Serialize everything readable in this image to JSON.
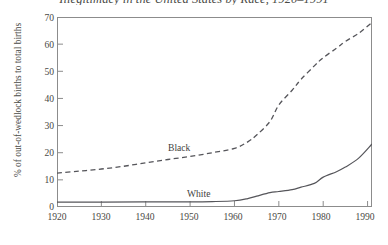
{
  "chart_data": {
    "type": "line",
    "title": "Illegitimacy in the United States by Race, 1920–1991",
    "xlabel": "",
    "ylabel": "% of out-of-wedlock births to total births",
    "xlim": [
      1920,
      1991
    ],
    "ylim": [
      0,
      70
    ],
    "grid": false,
    "legend_position": "inline-annotation",
    "xticks": [
      "1920",
      "1930",
      "1940",
      "1950",
      "1960",
      "1970",
      "1980",
      "1990"
    ],
    "xtick_values": [
      1920,
      1930,
      1940,
      1950,
      1960,
      1970,
      1980,
      1990
    ],
    "yticks": [
      "0",
      "10",
      "20",
      "30",
      "40",
      "50",
      "60",
      "70"
    ],
    "ytick_values": [
      0,
      10,
      20,
      30,
      40,
      50,
      60,
      70
    ],
    "series": [
      {
        "name": "Black",
        "style": "dashed",
        "color": "#55555a",
        "x": [
          1920,
          1925,
          1930,
          1935,
          1940,
          1945,
          1950,
          1955,
          1960,
          1963,
          1965,
          1968,
          1970,
          1973,
          1975,
          1978,
          1980,
          1983,
          1985,
          1988,
          1991
        ],
        "values": [
          12.5,
          13.2,
          14.0,
          15.0,
          16.3,
          17.5,
          18.6,
          20.0,
          21.6,
          24.0,
          26.5,
          31.5,
          37.6,
          43.0,
          47.0,
          52.0,
          55.0,
          58.5,
          61.0,
          64.0,
          68.0
        ]
      },
      {
        "name": "White",
        "style": "solid",
        "color": "#55555a",
        "x": [
          1920,
          1930,
          1940,
          1950,
          1955,
          1960,
          1963,
          1965,
          1968,
          1970,
          1973,
          1975,
          1978,
          1980,
          1983,
          1985,
          1988,
          1991
        ],
        "values": [
          1.8,
          1.8,
          1.9,
          1.9,
          2.0,
          2.3,
          3.1,
          4.0,
          5.3,
          5.7,
          6.4,
          7.3,
          8.7,
          11.0,
          13.0,
          14.7,
          18.0,
          23.2
        ]
      }
    ],
    "annotations": [
      {
        "text": "Black",
        "x": 1957,
        "y": 27.0
      },
      {
        "text": "White",
        "x": 1958,
        "y": 7.6
      }
    ]
  }
}
